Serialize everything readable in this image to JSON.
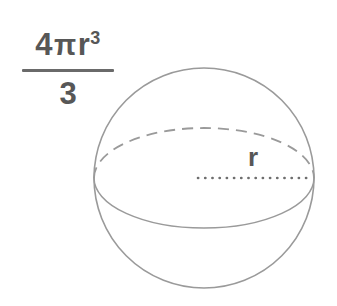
{
  "figure": {
    "background_color": "#ffffff",
    "stroke_color": "#999999",
    "text_color": "#575757",
    "dot_color": "#6e6e6e"
  },
  "formula": {
    "numerator_coefficient": "4",
    "numerator_pi": "π",
    "numerator_variable": "r",
    "numerator_exponent": "3",
    "denominator": "3",
    "full_text": "4πr³/3"
  },
  "diagram": {
    "sphere": {
      "label": "sphere-outline",
      "center_x": 204,
      "center_y": 178,
      "radius": 110
    },
    "equator": {
      "label": "equator-ellipse",
      "center_x": 204,
      "center_y": 178,
      "radius_x": 110,
      "radius_y": 50,
      "back_half_style": "dashed",
      "front_half_style": "solid"
    },
    "radius_line": {
      "label": "radius-dotted-line",
      "style": "dotted",
      "from_x": 198,
      "from_y": 178,
      "to_x": 313,
      "to_y": 178
    },
    "radius_label": "r"
  }
}
